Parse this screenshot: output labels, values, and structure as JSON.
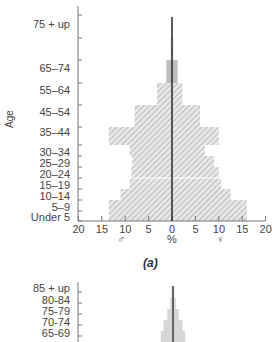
{
  "chart_data": [
    {
      "type": "bar",
      "subtype": "population-pyramid",
      "title": "",
      "caption": "(a)",
      "ylabel": "Age",
      "xlabel": "%",
      "xlabel_left": "♂",
      "xlabel_right": "♀",
      "xlim": [
        -20,
        20
      ],
      "x_ticks": [
        "20",
        "15",
        "10",
        "5",
        "0",
        "5",
        "10",
        "15",
        "20"
      ],
      "grid": false,
      "categories": [
        "Under 5",
        "5–9",
        "10–14",
        "15–19",
        "20–24",
        "25–29",
        "30–34",
        "35–44",
        "45–54",
        "55–64",
        "65–74",
        "75 + up"
      ],
      "series": [
        {
          "name": "Male",
          "values": [
            13.5,
            13.5,
            11,
            9,
            8.7,
            8.5,
            9,
            13.5,
            8,
            3.2,
            1.2,
            0.3
          ]
        },
        {
          "name": "Female",
          "values": [
            16,
            16,
            12.5,
            10.5,
            10,
            9,
            7,
            10,
            6,
            2.2,
            1.2,
            0.3
          ]
        }
      ]
    },
    {
      "type": "bar",
      "subtype": "population-pyramid",
      "partial": true,
      "categories_visible": [
        "85 + up",
        "80-84",
        "75-79",
        "70-74",
        "65-69"
      ],
      "series": [
        {
          "name": "Male",
          "values": [
            0.3,
            0.6,
            1.2,
            2.0,
            2.6
          ]
        },
        {
          "name": "Female",
          "values": [
            0.3,
            0.6,
            1.2,
            2.0,
            2.6
          ]
        }
      ]
    }
  ],
  "chart_a": {
    "age_axis_label": "Age",
    "pct_label": "%",
    "male_symbol": "♂",
    "female_symbol": "♀",
    "caption": "(a)",
    "category_labels": [
      "75 + up",
      "65–74",
      "55–64",
      "45–54",
      "35–44",
      "30–34",
      "25–29",
      "20–24",
      "15–19",
      "10–14",
      "5–9",
      "Under 5"
    ],
    "x_ticks": [
      "20",
      "15",
      "10",
      "5",
      "0",
      "5",
      "10",
      "15",
      "20"
    ]
  },
  "chart_b": {
    "category_labels": [
      "85 + up",
      "80-84",
      "75-79",
      "70-74",
      "65-69"
    ]
  }
}
